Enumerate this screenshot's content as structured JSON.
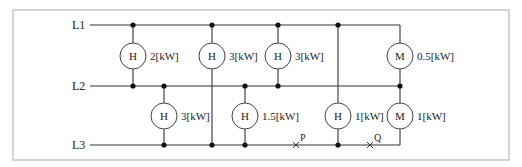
{
  "lines": [
    {
      "label": "L1",
      "y": 25
    },
    {
      "label": "L2",
      "y": 86
    },
    {
      "label": "L3",
      "y": 145
    }
  ],
  "loads": [
    {
      "type": "H",
      "rating": "2[kW]",
      "between": [
        "L1",
        "L2"
      ],
      "x": 133,
      "cy": 56
    },
    {
      "type": "H",
      "rating": "3[kW]",
      "between": [
        "L1",
        "L3"
      ],
      "x": 212,
      "cy": 56
    },
    {
      "type": "H",
      "rating": "3[kW]",
      "between": [
        "L1",
        "L2"
      ],
      "x": 278,
      "cy": 56
    },
    {
      "type": "M",
      "rating": "0.5[kW]",
      "between": [
        "L1",
        "L2"
      ],
      "x": 400,
      "cy": 56
    },
    {
      "type": "H",
      "rating": "3[kW]",
      "between": [
        "L2",
        "L3"
      ],
      "x": 164,
      "cy": 116
    },
    {
      "type": "H",
      "rating": "1.5[kW]",
      "between": [
        "L2",
        "L3"
      ],
      "x": 245,
      "cy": 116
    },
    {
      "type": "H",
      "rating": "1[kW]",
      "between": [
        "L1",
        "L3"
      ],
      "x": 338,
      "cy": 116
    },
    {
      "type": "M",
      "rating": "1[kW]",
      "between": [
        "L2",
        "L3"
      ],
      "x": 400,
      "cy": 116
    }
  ],
  "points": [
    {
      "label": "P",
      "x": 296,
      "y": 145
    },
    {
      "label": "Q",
      "x": 370,
      "y": 145
    }
  ],
  "junctions": [
    {
      "x": 133,
      "y": 25
    },
    {
      "x": 212,
      "y": 25
    },
    {
      "x": 278,
      "y": 25
    },
    {
      "x": 338,
      "y": 25
    },
    {
      "x": 133,
      "y": 86
    },
    {
      "x": 164,
      "y": 86
    },
    {
      "x": 245,
      "y": 86
    },
    {
      "x": 278,
      "y": 86
    },
    {
      "x": 400,
      "y": 86
    },
    {
      "x": 164,
      "y": 145
    },
    {
      "x": 212,
      "y": 145
    },
    {
      "x": 245,
      "y": 145
    },
    {
      "x": 338,
      "y": 145
    }
  ]
}
